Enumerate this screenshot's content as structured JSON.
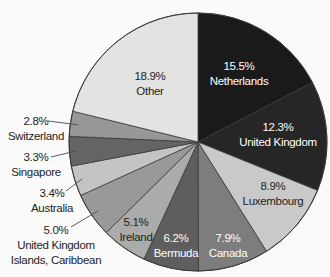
{
  "figure": {
    "background": "#fafafa",
    "outline_color": "#3a3a3a",
    "leader_color": "#4a4a4a",
    "dark_text": "#232323",
    "light_text": "#ffffff"
  },
  "chart_data": {
    "type": "pie",
    "title": "",
    "legend": "none",
    "start_angle_deg": 0,
    "direction": "clockwise",
    "geometry": {
      "cx": 198,
      "cy": 142,
      "r": 129
    },
    "slices": [
      {
        "name": "Netherlands",
        "value": 15.5,
        "pct": "15.5%",
        "color": "#1a1a1a",
        "label": {
          "placement": "inside",
          "color": "#ffffff",
          "x": 239,
          "y": 70,
          "lines": [
            "15.5%",
            "Netherlands"
          ]
        }
      },
      {
        "name": "United Kingdom",
        "value": 12.3,
        "pct": "12.3%",
        "color": "#262626",
        "label": {
          "placement": "inside",
          "color": "#ffffff",
          "x": 278,
          "y": 131,
          "lines": [
            "12.3%",
            "United Kingdom"
          ]
        }
      },
      {
        "name": "Luxembourg",
        "value": 8.9,
        "pct": "8.9%",
        "color": "#c9c9c9",
        "label": {
          "placement": "inside",
          "color": "#232323",
          "x": 273,
          "y": 190,
          "lines": [
            "8.9%",
            "Luxembourg"
          ]
        }
      },
      {
        "name": "Canada",
        "value": 7.9,
        "pct": "7.9%",
        "color": "#7d7d7d",
        "label": {
          "placement": "inside",
          "color": "#ffffff",
          "x": 228,
          "y": 242,
          "lines": [
            "7.9%",
            "Canada"
          ]
        }
      },
      {
        "name": "Bermuda",
        "value": 6.2,
        "pct": "6.2%",
        "color": "#5e5e5e",
        "label": {
          "placement": "inside",
          "color": "#ffffff",
          "x": 176,
          "y": 242,
          "lines": [
            "6.2%",
            "Bermuda"
          ]
        }
      },
      {
        "name": "Ireland",
        "value": 5.1,
        "pct": "5.1%",
        "color": "#ababab",
        "label": {
          "placement": "inside",
          "color": "#232323",
          "x": 136,
          "y": 226,
          "lines": [
            "5.1%",
            "Ireland"
          ]
        }
      },
      {
        "name": "United Kingdom Islands, Caribbean",
        "value": 5.0,
        "pct": "5.0%",
        "color": "#999999",
        "label": {
          "placement": "outside",
          "color": "#232323",
          "x": 56,
          "y": 234,
          "lines": [
            "5.0%",
            "United Kingdom",
            "Islands, Caribbean"
          ],
          "leader_from": [
            71,
            227
          ]
        }
      },
      {
        "name": "Australia",
        "value": 3.4,
        "pct": "3.4%",
        "color": "#c4c4c4",
        "label": {
          "placement": "outside",
          "color": "#232323",
          "x": 52,
          "y": 197,
          "lines": [
            "3.4%",
            "Australia"
          ],
          "leader_from": [
            66,
            191
          ]
        }
      },
      {
        "name": "Singapore",
        "value": 3.3,
        "pct": "3.3%",
        "color": "#646464",
        "label": {
          "placement": "outside",
          "color": "#232323",
          "x": 36,
          "y": 161,
          "lines": [
            "3.3%",
            "Singapore"
          ],
          "leader_from": [
            51,
            157
          ]
        }
      },
      {
        "name": "Switzerland",
        "value": 2.8,
        "pct": "2.8%",
        "color": "#979797",
        "label": {
          "placement": "outside",
          "color": "#232323",
          "x": 36,
          "y": 125,
          "lines": [
            "2.8%",
            "Switzerland"
          ],
          "leader_from": [
            48,
            121
          ]
        }
      },
      {
        "name": "Other",
        "value": 18.9,
        "pct": "18.9%",
        "color": "#e3e3e3",
        "label": {
          "placement": "inside",
          "color": "#232323",
          "x": 150,
          "y": 80,
          "lines": [
            "18.9%",
            "Other"
          ]
        }
      }
    ]
  }
}
